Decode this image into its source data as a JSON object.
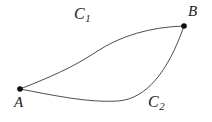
{
  "figure": {
    "background_color": "#ffffff",
    "stroke_color": "#3a3a3a",
    "text_color": "#1a1a1a",
    "width": 212,
    "height": 122
  },
  "points": [
    {
      "id": "A",
      "label": "A",
      "x": 20,
      "y": 89,
      "radius": 2.8,
      "label_x": 14,
      "label_y": 95
    },
    {
      "id": "B",
      "label": "B",
      "x": 184,
      "y": 26,
      "radius": 2.8,
      "label_x": 188,
      "label_y": 4
    }
  ],
  "curves": [
    {
      "id": "C1",
      "label_base": "C",
      "label_sub": "1",
      "label_x": 74,
      "label_y": 6,
      "from": "A",
      "to": "B",
      "shape": "S-curve bowing upward",
      "path": "M 20 89 C 48 78, 72 68, 96 52 C 120 36, 150 27, 184 26"
    },
    {
      "id": "C2",
      "label_base": "C",
      "label_sub": "2",
      "label_x": 148,
      "label_y": 94,
      "from": "A",
      "to": "B",
      "shape": "dips down then rises steeply",
      "path": "M 20 89 C 52 95, 88 103, 118 101 C 146 99, 168 72, 184 26"
    }
  ]
}
